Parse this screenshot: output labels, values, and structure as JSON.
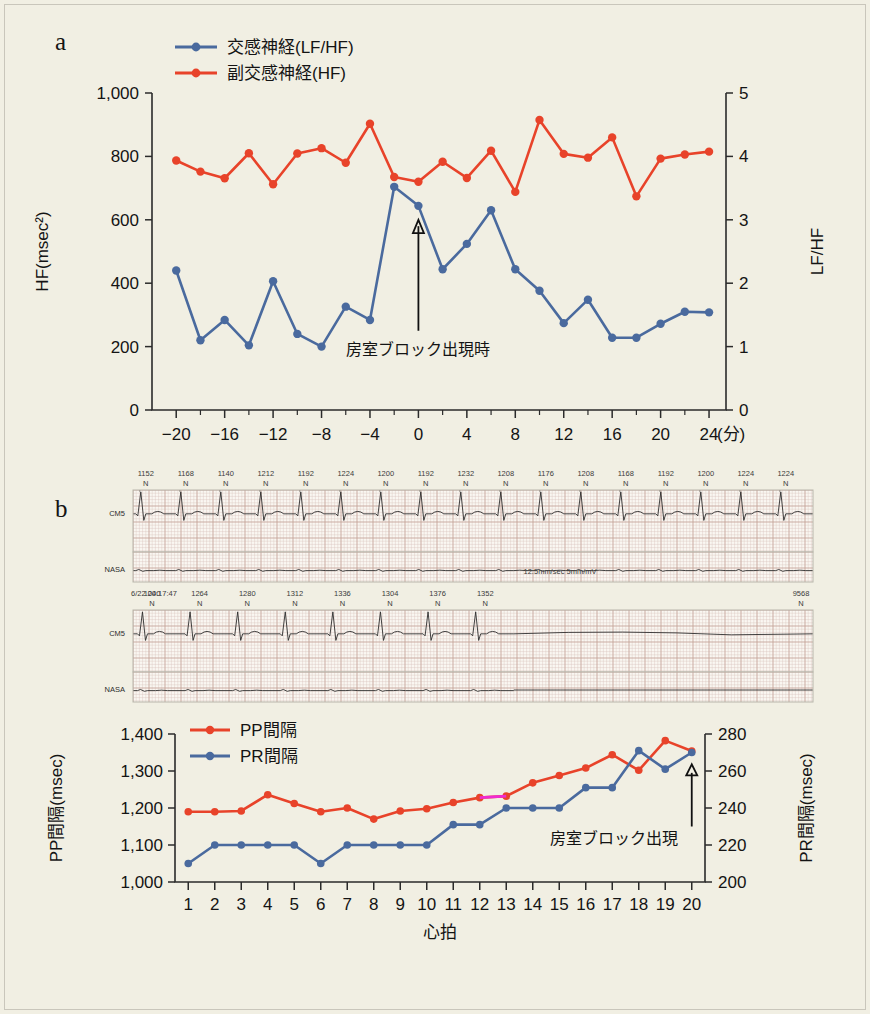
{
  "figure": {
    "panel_a_letter": "a",
    "panel_b_letter": "b"
  },
  "panel_a": {
    "legend": [
      {
        "label": "交感神経(LF/HF)",
        "color": "#4a6a9e",
        "key": "sympathetic"
      },
      {
        "label": "副交感神経(HF)",
        "color": "#e8432a",
        "key": "parasympathetic"
      }
    ],
    "y_left_title": "HF(msec²)",
    "y_right_title": "LF/HF",
    "x_unit_label": "(分)",
    "annotation": "房室ブロック出現時",
    "y_left_ticks": [
      "0",
      "200",
      "400",
      "600",
      "800",
      "1,000"
    ],
    "y_right_ticks": [
      "0",
      "1",
      "2",
      "3",
      "4",
      "5"
    ],
    "x_ticks": [
      "-20",
      "-16",
      "-12",
      "-8",
      "-4",
      "0",
      "4",
      "8",
      "12",
      "16",
      "20",
      "24"
    ]
  },
  "panel_b": {
    "strip1": {
      "leads": [
        "CM5",
        "NASA"
      ],
      "rr_values": [
        1152,
        1168,
        1140,
        1212,
        1192,
        1224,
        1200,
        1192,
        1232,
        1208,
        1176,
        1208,
        1168,
        1192,
        1200,
        1224,
        1224
      ],
      "beat_label": "N"
    },
    "strip2": {
      "leads": [
        "CM5",
        "NASA"
      ],
      "timestamp": "6/22 00:17:47",
      "rr_values": [
        1240,
        1264,
        1280,
        1312,
        1336,
        1304,
        1376,
        1352
      ],
      "last_value": 9568,
      "beat_label": "N"
    },
    "scale_note": "12.5mm/sec 5mm/mV"
  },
  "panel_c": {
    "legend": [
      {
        "label": "PP間隔",
        "color": "#e8432a",
        "key": "pp"
      },
      {
        "label": "PR間隔",
        "color": "#4a6a9e",
        "key": "pr"
      }
    ],
    "y_left_title": "PP間隔(msec)",
    "y_right_title": "PR間隔(msec)",
    "x_title": "心拍",
    "annotation": "房室ブロック出現",
    "y_left_ticks": [
      "1,000",
      "1,100",
      "1,200",
      "1,300",
      "1,400"
    ],
    "y_right_ticks": [
      "200",
      "220",
      "240",
      "260",
      "280"
    ],
    "x_ticks": [
      "1",
      "2",
      "3",
      "4",
      "5",
      "6",
      "7",
      "8",
      "9",
      "10",
      "11",
      "12",
      "13",
      "14",
      "15",
      "16",
      "17",
      "18",
      "19",
      "20"
    ]
  },
  "chart_data": [
    {
      "type": "line",
      "id": "panel-a",
      "title": "",
      "xlabel": "(分)",
      "ylabel": "HF(msec²)",
      "y2label": "LF/HF",
      "xlim": [
        -22,
        25
      ],
      "ylim": [
        0,
        1000
      ],
      "y2lim": [
        0,
        5
      ],
      "grid": false,
      "legend_position": "top-left",
      "x": [
        -20,
        -18,
        -16,
        -14,
        -12,
        -10,
        -8,
        -6,
        -4,
        -2,
        0,
        2,
        4,
        6,
        8,
        10,
        12,
        14,
        16,
        18,
        20,
        22,
        24
      ],
      "series": [
        {
          "name": "副交感神経(HF)",
          "axis": "left",
          "color": "#e8432a",
          "values": [
            787,
            752,
            731,
            810,
            712,
            809,
            826,
            780,
            903,
            735,
            720,
            783,
            732,
            818,
            688,
            915,
            808,
            796,
            860,
            674,
            793,
            806,
            815
          ]
        },
        {
          "name": "交感神経(LF/HF)",
          "axis": "right",
          "color": "#4a6a9e",
          "values": [
            2.2,
            1.1,
            1.42,
            1.02,
            2.03,
            1.2,
            1.0,
            1.63,
            1.42,
            3.52,
            3.22,
            2.22,
            2.62,
            3.15,
            2.22,
            1.88,
            1.37,
            1.74,
            1.14,
            1.14,
            1.36,
            1.55,
            1.54
          ]
        }
      ],
      "annotations": [
        {
          "text": "房室ブロック出現時",
          "x": 0,
          "y": 250,
          "arrow_to_y": 560
        }
      ]
    },
    {
      "type": "line",
      "id": "panel-c",
      "title": "",
      "xlabel": "心拍",
      "ylabel": "PP間隔(msec)",
      "y2label": "PR間隔(msec)",
      "xlim": [
        0.5,
        20.5
      ],
      "ylim": [
        1000,
        1400
      ],
      "y2lim": [
        200,
        280
      ],
      "grid": false,
      "legend_position": "top-left",
      "categories": [
        1,
        2,
        3,
        4,
        5,
        6,
        7,
        8,
        9,
        10,
        11,
        12,
        13,
        14,
        15,
        16,
        17,
        18,
        19,
        20
      ],
      "series": [
        {
          "name": "PP間隔",
          "axis": "left",
          "color": "#e8432a",
          "values": [
            1190,
            1190,
            1192,
            1236,
            1212,
            1190,
            1200,
            1170,
            1192,
            1198,
            1215,
            1228,
            1232,
            1268,
            1288,
            1308,
            1344,
            1302,
            1382,
            1354
          ]
        },
        {
          "name": "PR間隔",
          "axis": "right",
          "color": "#4a6a9e",
          "values": [
            210,
            220,
            220,
            220,
            220,
            210,
            220,
            220,
            220,
            220,
            231,
            231,
            240,
            240,
            240,
            251,
            251,
            271,
            261,
            270
          ]
        }
      ],
      "highlight_segment": {
        "color": "#f02ad2",
        "from_x": 12,
        "to_x": 13,
        "series": "PP間隔"
      },
      "annotations": [
        {
          "text": "房室ブロック出現",
          "x": 20,
          "y": 1150,
          "arrow_to_y": 1300
        }
      ]
    }
  ]
}
